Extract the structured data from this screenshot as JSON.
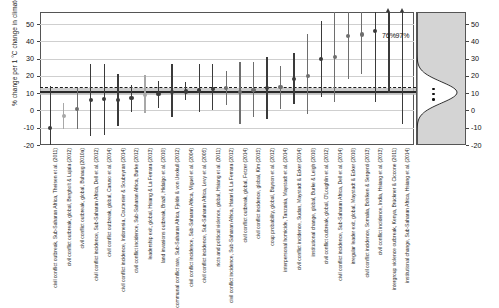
{
  "chart_data": {
    "type": "scatter",
    "subtype": "forest-plot",
    "title": "",
    "ylabel": "% change per 1 °C change in climate",
    "xlabel": "",
    "ylim": [
      -20,
      57
    ],
    "yticks": [
      -20,
      -10,
      0,
      10,
      20,
      30,
      40,
      50
    ],
    "ytick_labels": [
      "-20",
      "-10",
      "0",
      "10",
      "20",
      "30",
      "40",
      "50"
    ],
    "right_axis_ticks": [
      -20,
      -10,
      0,
      10,
      20,
      30,
      40,
      50
    ],
    "right_axis_tick_labels": [
      "-20",
      "-10",
      "0",
      "10",
      "20",
      "30",
      "40",
      "50"
    ],
    "grid": true,
    "legend": "none",
    "mean_line_value": 11.0,
    "median_line_value": 13.5,
    "mean_band_range": [
      9.0,
      13.0
    ],
    "annotations": [
      {
        "text": "76%",
        "x_index": 37,
        "y": 43
      },
      {
        "text": "97%",
        "x_index": 39,
        "y": 43
      }
    ],
    "density_panel": {
      "label": "density of estimates",
      "peak_value": 11,
      "dots": [
        13,
        10,
        7
      ]
    },
    "categories": [
      "civil conflict outbreak, Sub-Saharan Africa",
      "civil conflict outbreak, global",
      "civil conflict incidence, Sub-Saharan Africa",
      "civil conflict outbreak, global",
      "civil conflict incidence, Indonesia",
      "civil conflict incidence, Sub-Saharan Africa",
      "leadership exit, global",
      "land invasions outbreak, Brazil",
      "communal conflict rate, Sub-Saharan Africa",
      "civil conflict outbreak, global",
      "civil conflict incidence, Sub-Saharan Africa",
      "civil conflict incidence, Sub-Saharan Africa",
      "riots and political violence, Sub-Saharan Africa",
      "civil conflict incidence, Sub-Saharan Africa",
      "civil conflict outbreak, global",
      "civil conflict incidence, global",
      "civil conflict incidence, Sub-Saharan Africa",
      "civil conflict incidence, global",
      "coup probability, global",
      "interpersonal homicide, Tanzania",
      "civil conflict incidence, Sudan",
      "institutional change, global",
      "civil conflict outbreak, global",
      "civil conflict incidence, Sub-Saharan Africa",
      "irregular leader exit, global",
      "civil conflict incidence, Somalia",
      "civil conflict incidence, India",
      "intergroup violence outbreak, Kenya",
      "institutional change, Sub-Saharan Africa",
      "civil conflict outbreak, Sub-Saharan Africa"
    ],
    "studies": [
      {
        "label": "civil conflict outbreak, Sub-Saharan Africa",
        "citation": "Theisen et al. (2011)",
        "estimate": -10.0,
        "ci_low": -20.0,
        "ci_high": 14.0,
        "shade": "dark"
      },
      {
        "label": "civil conflict outbreak, global",
        "citation": "Bergholt & Lujala (2012)",
        "estimate": -3.0,
        "ci_low": -10.5,
        "ci_high": 4.5,
        "shade": "light"
      },
      {
        "label": "civil conflict outbreak, global",
        "citation": "Buhaug (2010a)",
        "estimate": 0.8,
        "ci_low": -11.0,
        "ci_high": 13.0,
        "shade": "medium"
      },
      {
        "label": "civil conflict incidence, Sub-Saharan Africa",
        "citation": "Dell et al. (2012)",
        "estimate": 6.0,
        "ci_low": -15.0,
        "ci_high": 27.0,
        "shade": "dark"
      },
      {
        "label": "civil conflict outbreak, global",
        "citation": "Caruso et al. (2014)",
        "estimate": 6.5,
        "ci_low": -14.5,
        "ci_high": 27.0,
        "shade": "dark"
      },
      {
        "label": "civil conflict incidence, Indonesia",
        "citation": "Couttenier & Soubeyran (2014)",
        "estimate": 6.2,
        "ci_low": -9.0,
        "ci_high": 21.0,
        "shade": "dark"
      },
      {
        "label": "civil conflict incidence, Sub-Saharan Africa",
        "citation": "Burke (2012)",
        "estimate": 7.0,
        "ci_low": -1.0,
        "ci_high": 14.5,
        "shade": "dark"
      },
      {
        "label": "leadership exit, global",
        "citation": "Hsiang & La Ferrara (2013)",
        "estimate": 9.0,
        "ci_low": -1.5,
        "ci_high": 20.5,
        "shade": "light"
      },
      {
        "label": "land invasions outbreak, Brazil",
        "citation": "Hidalgo et al. (2010)",
        "estimate": 9.5,
        "ci_low": 1.5,
        "ci_high": 17.0,
        "shade": "dark"
      },
      {
        "label": "communal conflict rate, Sub-Saharan Africa",
        "citation": "Fjelde & von Uexkull (2012)",
        "estimate": 10.5,
        "ci_low": -4.0,
        "ci_high": 27.0,
        "shade": "dark"
      },
      {
        "label": "civil conflict incidence, Sub-Saharan Africa",
        "citation": "Miguel et al. (2004)",
        "estimate": 11.0,
        "ci_low": 6.0,
        "ci_high": 16.5,
        "shade": "dark"
      },
      {
        "label": "civil conflict incidence, Sub-Saharan Africa",
        "citation": "Levy et al. (2005)",
        "estimate": 11.5,
        "ci_low": -1.0,
        "ci_high": 27.0,
        "shade": "dark"
      },
      {
        "label": "riots and political violence, global",
        "citation": "Hsiang et al. (2011)",
        "estimate": 12.5,
        "ci_low": 0.0,
        "ci_high": 27.0,
        "shade": "dark"
      },
      {
        "label": "civil conflict incidence, Sub-Saharan Africa",
        "citation": "Harari & La Ferrara (2012)",
        "estimate": 12.8,
        "ci_low": 3.0,
        "ci_high": 23.0,
        "shade": "medium"
      },
      {
        "label": "civil conflict outbreak, global",
        "citation": "Fetzer (2014)",
        "estimate": 10.5,
        "ci_low": -8.0,
        "ci_high": 28.0,
        "shade": "medium"
      },
      {
        "label": "civil conflict incidence, global",
        "citation": "Kim (2015)",
        "estimate": 12.0,
        "ci_low": -4.0,
        "ci_high": 28.0,
        "shade": "medium"
      },
      {
        "label": "coup probability, global",
        "citation": "Bayson et al. (2012)",
        "estimate": 13.0,
        "ci_low": -5.0,
        "ci_high": 31.0,
        "shade": "dark"
      },
      {
        "label": "interpersonal homicide, Tanzania",
        "citation": "Maystadt et al. (2014)",
        "estimate": 13.5,
        "ci_low": 1.0,
        "ci_high": 26.0,
        "shade": "medium"
      },
      {
        "label": "civil conflict incidence, Sudan",
        "citation": "Maystadt & Ecker (2014)",
        "estimate": 18.0,
        "ci_low": 4.0,
        "ci_high": 33.0,
        "shade": "dark"
      },
      {
        "label": "institutional change, global",
        "citation": "Burke & Leigh (2010)",
        "estimate": 20.0,
        "ci_low": -2.0,
        "ci_high": 44.0,
        "shade": "medium"
      },
      {
        "label": "civil conflict outbreak, global",
        "citation": "O'Loughlin et al. (2012)",
        "estimate": 30.0,
        "ci_low": 8.0,
        "ci_high": 52.0,
        "shade": "dark"
      },
      {
        "label": "civil conflict incidence, Sub-Saharan Africa",
        "citation": "Dell et al. (2014)",
        "estimate": 31.0,
        "ci_low": 5.0,
        "ci_high": 57.0,
        "shade": "medium"
      },
      {
        "label": "irregular leader exit, global",
        "citation": "Maystadt & Ecker (2010)",
        "estimate": 43.0,
        "ci_low": 18.0,
        "ci_high": 57.0,
        "shade": "medium"
      },
      {
        "label": "civil conflict incidence, Somalia",
        "citation": "Bohlken & Sergenti (2013)",
        "estimate": 44.0,
        "ci_low": 21.0,
        "ci_high": 57.0,
        "shade": "medium"
      },
      {
        "label": "civil conflict incidence, India",
        "citation": "Hsiang et al. (2013)",
        "estimate": 46.0,
        "ci_low": 5.0,
        "ci_high": 57.0,
        "shade": "dark"
      },
      {
        "label": "intergroup violence outbreak, Kenya",
        "citation": "Brückner & Ciccone (2011)",
        "estimate": 52.0,
        "ci_low": 10.0,
        "ci_high": 57.0,
        "shade": "dark",
        "truncated": true,
        "truncated_label": "76%"
      },
      {
        "label": "institutional change, Sub-Saharan Africa",
        "citation": "Hsiang et al. (2014)",
        "estimate": 53.0,
        "ci_low": -8.0,
        "ci_high": 57.0,
        "shade": "dark",
        "truncated": true,
        "truncated_label": "97%"
      }
    ]
  },
  "axis_labels_full": [
    "civil conflict outbreak, Sub-Saharan Africa\nTheisen et al. (2011)",
    "civil conflict outbreak, global\nBergholt & Lujala (2012)",
    "civil conflict outbreak, global\nBuhaug (2010a)",
    "civil conflict incidence, Sub-Saharan Africa\nDell et al. (2012)",
    "civil conflict outbreak, global\nCaruso et al. (2014)",
    "civil conflict incidence, Indonesia\nCouttenier & Soubeyran (2014)",
    "civil conflict incidence, Sub-Saharan Africa\nBurke (2012)",
    "leadership exit, global\nHsiang & La Ferrara (2013)",
    "land invasions outbreak, Brazil\nHidalgo et al. (2010)",
    "communal conflict rate, Sub-Saharan Africa\nFjelde & von Uexkull (2012)",
    "civil conflict incidence, Sub-Saharan Africa\nMiguel et al. (2004)",
    "civil conflict incidence, Sub-Saharan Africa\nLevy et al. (2005)",
    "riots and political violence, global\nHsiang et al. (2011)",
    "civil conflict outbreak, global\nFetzer (2014)",
    "civil conflict incidence, global\nKim (2015)",
    "coup probability, global\nBayson et al. (2012)",
    "interpersonal homicide, Tanzania\nMaystadt et al. (2014)",
    "civil conflict incidence, Sudan\nMaystadt & Ecker (2014)",
    "institutional change, global\nBurke & Leigh (2010)",
    "civil conflict outbreak, global\nO'Loughlin et al. (2012)",
    "civil conflict incidence, Sub-Saharan Africa\nDell et al. (2014)",
    "irregular leader exit, global\nMaystadt & Ecker (2010)",
    "civil conflict incidence, Somalia\nBohlken & Sergenti (2013)",
    "civil conflict incidence, India\nHsiang et al. (2013)",
    "intergroup violence outbreak, Kenya\nBrückner & Ciccone (2011)",
    "institutional change, Sub-Saharan Africa\nHsiang et al. (2014)"
  ],
  "xtick_labels": [
    "civil conflict outbreak, Sub-Saharan Africa",
    "Theisen et al. (2011)",
    "civil conflict outbreak, global",
    "Bergholt & Lujala (2012)",
    "civil conflict outbreak, global",
    "Buhaug (2010a)",
    "civil conflict incidence, Sub-Saharan Africa",
    "Dell et al. (2012)",
    "civil conflict outbreak, global",
    "Caruso et al. (2014)",
    "civil conflict incidence, Indonesia",
    "Couttenier & Soubeyran (2014)",
    "civil conflict incidence, Sub-Saharan Africa",
    "Burke (2012)",
    "leadership exit, global",
    "Hsiang & La Ferrara (2013)",
    "land invasions outbreak, Brazil",
    "Hidalgo et al. (2010)",
    "communal conflict rate, Sub-Saharan Africa",
    "Fjelde & von Uexkull (2012)",
    "civil conflict incidence, Sub-Saharan Africa",
    "Miguel et al. (2004)",
    "civil conflict incidence, Sub-Saharan Africa",
    "Levy et al. (2005)",
    "riots and political violence, global",
    "Hsiang et al. (2011)",
    "civil conflict outbreak, global",
    "Fetzer (2014)",
    "civil conflict incidence, global",
    "Kim (2015)",
    "coup probability, global",
    "Bayson et al. (2012)",
    "interpersonal homicide, Tanzania",
    "Maystadt et al. (2014)",
    "civil conflict incidence, Sudan",
    "Maystadt & Ecker (2014)",
    "institutional change, global",
    "Burke & Leigh (2010)",
    "civil conflict outbreak, global",
    "O'Loughlin et al. (2012)",
    "civil conflict incidence, Sub-Saharan Africa",
    "Dell et al. (2014)",
    "irregular leader exit, global",
    "Maystadt & Ecker (2010)",
    "civil conflict incidence, Somalia",
    "Bohlken & Sergenti (2013)",
    "civil conflict incidence, India",
    "Hsiang et al. (2013)",
    "intergroup violence outbreak, Kenya",
    "Brückner & Ciccone (2011)",
    "institutional change, Sub-Saharan Africa",
    "Hsiang et al. (2014)"
  ],
  "colors": {
    "dark_marker": "#3a3a3a",
    "medium_marker": "#6e6e6e",
    "light_marker": "#a8a8a8",
    "grid": "#cfcfcf",
    "band": "#b9b9b9",
    "mean_line": "#2a2a2a",
    "density_fill": "#d4d4d4",
    "frame": "#555555"
  }
}
